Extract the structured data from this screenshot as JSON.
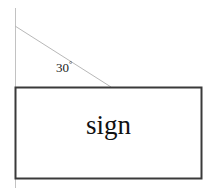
{
  "diagram": {
    "angle": {
      "value": "30",
      "degree_symbol": "°",
      "full_label": "30°"
    },
    "rectangle": {
      "label": "sign"
    },
    "colors": {
      "background": "#ffffff",
      "rectangle_border": "#3a3a3a",
      "rectangle_fill": "#ffffff",
      "reference_line": "#c2c2c2",
      "inclined_line": "#b8b8b8",
      "text": "#111111"
    },
    "geometry": {
      "vertical_reference_line": {
        "x": 15,
        "y_top": 8,
        "y_bottom": 188
      },
      "inclined_line": {
        "x1": 15,
        "y1": 26,
        "x2": 110,
        "y2": 87
      },
      "rectangle": {
        "left": 15,
        "top": 87,
        "right": 201,
        "bottom": 178
      }
    }
  }
}
